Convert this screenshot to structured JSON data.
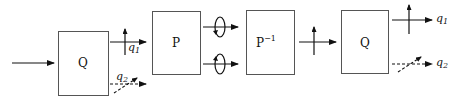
{
  "diagram": {
    "blocks": [
      {
        "id": "q-in",
        "label": "Q"
      },
      {
        "id": "p",
        "label": "P"
      },
      {
        "id": "p-inv",
        "label": "P",
        "superscript": "−1"
      },
      {
        "id": "q-out",
        "label": "Q"
      }
    ],
    "outputs": {
      "first": {
        "q1": "q",
        "q1_sub": "1",
        "q2": "q",
        "q2_sub": "2"
      },
      "last": {
        "q1": "q",
        "q1_sub": "1",
        "q2": "q",
        "q2_sub": "2"
      }
    },
    "colors": {
      "stroke": "#111111",
      "box_border": "#555555",
      "background": "#ffffff"
    }
  }
}
